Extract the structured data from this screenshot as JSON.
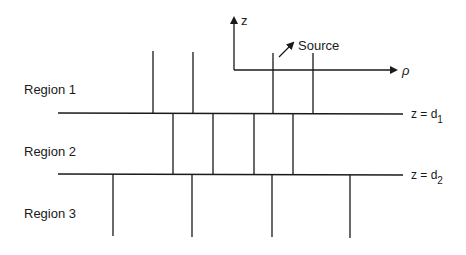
{
  "diagram": {
    "axes": {
      "z_label": "z",
      "rho_label": "ρ",
      "source_label": "Source"
    },
    "regions": [
      {
        "label": "Region 1"
      },
      {
        "label": "Region 2"
      },
      {
        "label": "Region 3"
      }
    ],
    "interfaces": [
      {
        "prefix": "z = d",
        "subscript": "1"
      },
      {
        "prefix": "z = d",
        "subscript": "2"
      }
    ],
    "colors": {
      "ink": "#1a1a1a",
      "background": "#ffffff"
    }
  }
}
